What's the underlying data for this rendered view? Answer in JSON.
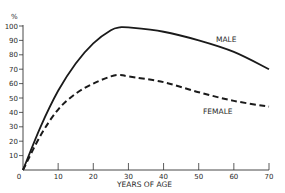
{
  "chart_data": {
    "type": "line",
    "title": "",
    "xlabel": "YEARS OF AGE",
    "ylabel": "%",
    "xlim": [
      0,
      70
    ],
    "ylim": [
      0,
      100
    ],
    "x_ticks": [
      0,
      10,
      20,
      30,
      40,
      50,
      60,
      70
    ],
    "y_ticks": [
      10,
      20,
      30,
      40,
      50,
      60,
      70,
      80,
      90,
      100
    ],
    "x_tick_labels": [
      "0",
      "10",
      "20",
      "30",
      "40",
      "50",
      "60",
      "70"
    ],
    "y_tick_labels": [
      "10",
      "20",
      "30",
      "40",
      "50",
      "60",
      "70",
      "80",
      "90",
      "100"
    ],
    "grid": false,
    "legend": "inline labels",
    "x": [
      0,
      5,
      10,
      15,
      20,
      25,
      27.5,
      30,
      40,
      50,
      60,
      70
    ],
    "series": [
      {
        "name": "MALE",
        "style": "solid",
        "values": [
          0,
          30,
          55,
          74,
          88,
          97,
          99,
          99,
          96,
          90,
          82,
          70
        ]
      },
      {
        "name": "FEMALE",
        "style": "dashed",
        "values": [
          0,
          24,
          42,
          53,
          60,
          65,
          66,
          65,
          61,
          54,
          48,
          44
        ]
      }
    ],
    "annotations": [
      {
        "text": "MALE",
        "x": 47,
        "y": 87
      },
      {
        "text": "FEMALE",
        "x": 48,
        "y": 39
      }
    ]
  },
  "labels": {
    "y_unit": "%",
    "x_axis": "YEARS OF AGE",
    "male": "MALE",
    "female": "FEMALE",
    "origin": "0"
  }
}
